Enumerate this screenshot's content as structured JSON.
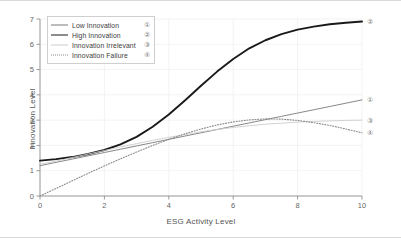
{
  "chart_data": {
    "type": "line",
    "title": "",
    "xlabel": "ESG Activity Level",
    "ylabel": "Innovation Level",
    "xlim": [
      0,
      10
    ],
    "ylim": [
      0,
      7
    ],
    "xticks": [
      "0",
      "2",
      "4",
      "6",
      "8",
      "10"
    ],
    "yticks": [
      "0",
      "1",
      "2",
      "3",
      "4",
      "5",
      "6",
      "7"
    ],
    "grid": true,
    "legend_position": "upper left",
    "x": [
      0,
      0.5,
      1,
      1.5,
      2,
      2.5,
      3,
      3.5,
      4,
      4.5,
      5,
      5.5,
      6,
      6.5,
      7,
      7.5,
      8,
      8.5,
      9,
      9.5,
      10
    ],
    "series": [
      {
        "name": "Low Innovation",
        "marker": "①",
        "color": "#7a7a7a",
        "style": "solid-thin",
        "values": [
          1.2,
          1.33,
          1.46,
          1.59,
          1.72,
          1.85,
          1.98,
          2.11,
          2.24,
          2.37,
          2.5,
          2.63,
          2.76,
          2.89,
          3.02,
          3.15,
          3.28,
          3.41,
          3.54,
          3.67,
          3.8
        ]
      },
      {
        "name": "High Innovation",
        "marker": "②",
        "color": "#1a1a1a",
        "style": "solid-thick",
        "values": [
          1.4,
          1.46,
          1.54,
          1.66,
          1.82,
          2.04,
          2.34,
          2.74,
          3.22,
          3.78,
          4.36,
          4.92,
          5.42,
          5.84,
          6.16,
          6.4,
          6.58,
          6.7,
          6.79,
          6.85,
          6.9
        ]
      },
      {
        "name": "Innovation Irrelevant",
        "marker": "③",
        "color": "#cdcdcd",
        "style": "solid-faint",
        "values": [
          1.25,
          1.38,
          1.52,
          1.66,
          1.8,
          1.94,
          2.07,
          2.2,
          2.32,
          2.43,
          2.54,
          2.63,
          2.71,
          2.78,
          2.84,
          2.88,
          2.92,
          2.95,
          2.97,
          2.99,
          3.0
        ]
      },
      {
        "name": "Innovation Failure",
        "marker": "④",
        "color": "#8a8a8a",
        "style": "dotted",
        "values": [
          0.0,
          0.3,
          0.6,
          0.9,
          1.19,
          1.47,
          1.74,
          2.0,
          2.24,
          2.46,
          2.65,
          2.81,
          2.93,
          3.01,
          3.05,
          3.04,
          2.99,
          2.9,
          2.79,
          2.65,
          2.5
        ]
      }
    ]
  },
  "legend": {
    "items": [
      {
        "label": "Low Innovation",
        "num": "①"
      },
      {
        "label": "High Innovation",
        "num": "②"
      },
      {
        "label": "Innovation Irrelevant",
        "num": "③"
      },
      {
        "label": "Innovation Failure",
        "num": "④"
      }
    ]
  }
}
